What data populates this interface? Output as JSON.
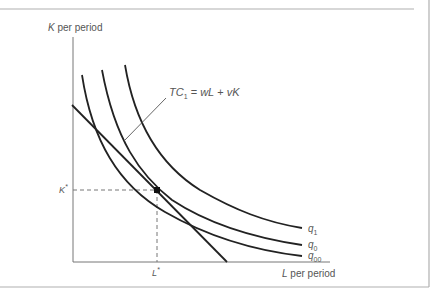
{
  "figure": {
    "axis_labels": {
      "y": "K per period",
      "y_var": "K",
      "y_rest": " per period",
      "x": "L per period",
      "x_var": "L",
      "x_rest": " per period"
    },
    "equilibrium": {
      "k_label": "K*",
      "l_label": "L*"
    },
    "cost_line": {
      "label": "TC1 = wL + vK",
      "tc": "TC",
      "tc_sub": "1",
      "rhs_a": " = ",
      "w": "wL",
      "plus": " + ",
      "v": "vK"
    },
    "isoquants": [
      {
        "name": "q1",
        "base": "q",
        "sub": "1"
      },
      {
        "name": "q0",
        "base": "q",
        "sub": "0"
      },
      {
        "name": "q00",
        "base": "q",
        "sub": "00"
      }
    ],
    "colors": {
      "curve": "#222222",
      "axis": "#777777",
      "frame": "#aaaaaa",
      "label": "#555555"
    }
  }
}
